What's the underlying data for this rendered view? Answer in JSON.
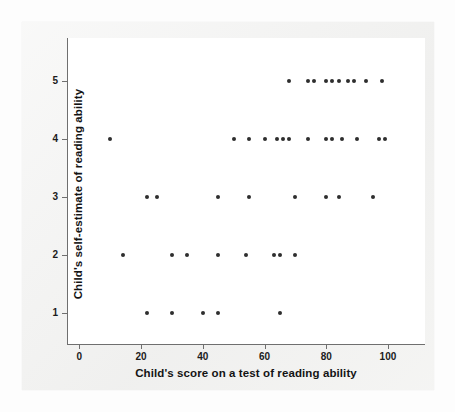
{
  "chart_data": {
    "type": "scatter",
    "title": "",
    "xlabel": "Child's score on a test of reading ability",
    "ylabel": "Child's self-estimate of reading ability",
    "xlim": [
      -4,
      112
    ],
    "ylim": [
      0.45,
      5.75
    ],
    "grid": false,
    "legend": null,
    "xticks": [
      0,
      20,
      40,
      60,
      80,
      100
    ],
    "xtick_labels": [
      "0",
      "20",
      "40",
      "60",
      "80",
      "100"
    ],
    "yticks": [
      1,
      2,
      3,
      4,
      5
    ],
    "ytick_labels": [
      "1",
      "2",
      "3",
      "4",
      "5"
    ],
    "marker": "filled-circle",
    "marker_color": "#2e2e2e",
    "marker_size_px": 4,
    "n_points": 57,
    "points": [
      {
        "x": 68,
        "y": 5
      },
      {
        "x": 74,
        "y": 5
      },
      {
        "x": 76,
        "y": 5
      },
      {
        "x": 80,
        "y": 5
      },
      {
        "x": 82,
        "y": 5
      },
      {
        "x": 84,
        "y": 5
      },
      {
        "x": 87,
        "y": 5
      },
      {
        "x": 89,
        "y": 5
      },
      {
        "x": 93,
        "y": 5
      },
      {
        "x": 98,
        "y": 5
      },
      {
        "x": 10,
        "y": 4
      },
      {
        "x": 50,
        "y": 4
      },
      {
        "x": 55,
        "y": 4
      },
      {
        "x": 60,
        "y": 4
      },
      {
        "x": 64,
        "y": 4
      },
      {
        "x": 66,
        "y": 4
      },
      {
        "x": 68,
        "y": 4
      },
      {
        "x": 74,
        "y": 4
      },
      {
        "x": 80,
        "y": 4
      },
      {
        "x": 82,
        "y": 4
      },
      {
        "x": 85,
        "y": 4
      },
      {
        "x": 90,
        "y": 4
      },
      {
        "x": 97,
        "y": 4
      },
      {
        "x": 99,
        "y": 4
      },
      {
        "x": 22,
        "y": 3
      },
      {
        "x": 25,
        "y": 3
      },
      {
        "x": 45,
        "y": 3
      },
      {
        "x": 55,
        "y": 3
      },
      {
        "x": 70,
        "y": 3
      },
      {
        "x": 80,
        "y": 3
      },
      {
        "x": 84,
        "y": 3
      },
      {
        "x": 95,
        "y": 3
      },
      {
        "x": 14,
        "y": 2
      },
      {
        "x": 30,
        "y": 2
      },
      {
        "x": 35,
        "y": 2
      },
      {
        "x": 45,
        "y": 2
      },
      {
        "x": 54,
        "y": 2
      },
      {
        "x": 63,
        "y": 2
      },
      {
        "x": 65,
        "y": 2
      },
      {
        "x": 70,
        "y": 2
      },
      {
        "x": 22,
        "y": 1
      },
      {
        "x": 30,
        "y": 1
      },
      {
        "x": 40,
        "y": 1
      },
      {
        "x": 45,
        "y": 1
      },
      {
        "x": 65,
        "y": 1
      }
    ]
  },
  "figure": {
    "background_color": "#f1f1f0",
    "plot_background_color": "#ffffff",
    "axis_color": "#6f6f6f"
  }
}
